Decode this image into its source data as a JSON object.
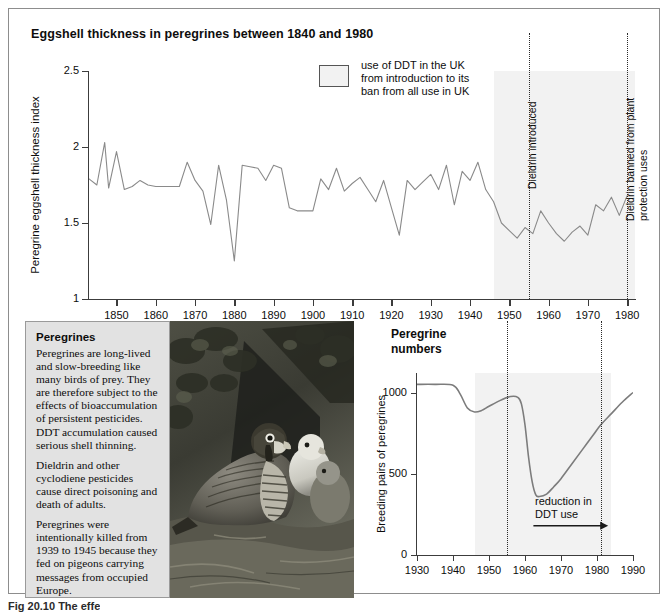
{
  "figure": {
    "title": "Eggshell thickness in peregrines between 1840 and 1980",
    "caption": "Fig 20.10  The effe"
  },
  "legend": {
    "label": "use of DDT in the UK from introduction to its ban from all use in UK",
    "swatch_color": "#f2f2f2"
  },
  "info_panel": {
    "heading": "Peregrines",
    "paragraphs": [
      "Peregrines are long-lived and slow-breeding like many birds of prey. They are therefore subject to the effects of bioaccumulation of persistent pesticides. DDT accumulation caused serious shell thinning.",
      "Dieldrin and other cyclodiene pesticides cause direct poisoning and death of adults.",
      "Peregrines were intentionally killed from 1939 to 1945 because they fed on pigeons carrying messages from occupied Europe."
    ]
  },
  "photo": {
    "alt": "black-and-white photograph of an adult peregrine falcon with two downy chicks at a cliff nest"
  },
  "chart_data": [
    {
      "type": "line",
      "id": "eggshell-thickness",
      "title": "Eggshell thickness in peregrines between 1840 and 1980",
      "xlabel": "",
      "ylabel": "Peregrine eggshell thickness index",
      "xlim": [
        1843,
        1982
      ],
      "ylim": [
        1,
        2.5
      ],
      "yticks": [
        1,
        1.5,
        2,
        2.5
      ],
      "ytick_labels": [
        "1",
        "1.5",
        "2",
        "2.5"
      ],
      "xticks": [
        1850,
        1860,
        1870,
        1880,
        1890,
        1900,
        1910,
        1920,
        1930,
        1940,
        1950,
        1960,
        1970,
        1980
      ],
      "xtick_labels": [
        "1850",
        "1860",
        "1870",
        "1880",
        "1890",
        "1900",
        "1910",
        "1920",
        "1930",
        "1940",
        "1950",
        "1960",
        "1970",
        "1980"
      ],
      "grid": false,
      "line_color": "#8a8a8a",
      "shaded_region": {
        "label": "use of DDT in the UK",
        "from": 1946,
        "to": 1985,
        "color": "#f2f2f2"
      },
      "annotations": [
        {
          "label": "Dieldrin introduced",
          "x": 1955
        },
        {
          "label": "Dieldrin banned from plant protection uses",
          "x": 1980
        }
      ],
      "x": [
        1843,
        1845,
        1847,
        1848,
        1850,
        1852,
        1854,
        1856,
        1858,
        1860,
        1862,
        1864,
        1866,
        1868,
        1870,
        1872,
        1874,
        1876,
        1878,
        1880,
        1882,
        1884,
        1886,
        1888,
        1890,
        1892,
        1894,
        1896,
        1898,
        1900,
        1902,
        1904,
        1906,
        1908,
        1910,
        1912,
        1914,
        1916,
        1918,
        1920,
        1922,
        1924,
        1926,
        1928,
        1930,
        1932,
        1934,
        1936,
        1938,
        1940,
        1942,
        1944,
        1946,
        1948,
        1950,
        1952,
        1954,
        1956,
        1958,
        1960,
        1962,
        1964,
        1966,
        1968,
        1970,
        1972,
        1974,
        1976,
        1978,
        1980
      ],
      "values": [
        1.79,
        1.75,
        2.03,
        1.73,
        1.97,
        1.72,
        1.74,
        1.78,
        1.75,
        1.74,
        1.74,
        1.74,
        1.74,
        1.9,
        1.78,
        1.71,
        1.49,
        1.88,
        1.65,
        1.25,
        1.88,
        1.87,
        1.86,
        1.78,
        1.88,
        1.86,
        1.6,
        1.58,
        1.58,
        1.58,
        1.79,
        1.72,
        1.86,
        1.71,
        1.76,
        1.8,
        1.72,
        1.64,
        1.78,
        1.6,
        1.42,
        1.78,
        1.72,
        1.77,
        1.82,
        1.72,
        1.88,
        1.62,
        1.84,
        1.78,
        1.9,
        1.72,
        1.64,
        1.5,
        1.45,
        1.4,
        1.47,
        1.43,
        1.58,
        1.5,
        1.43,
        1.38,
        1.44,
        1.48,
        1.42,
        1.62,
        1.58,
        1.67,
        1.55,
        1.68
      ]
    },
    {
      "type": "line",
      "id": "peregrine-numbers",
      "title": "Peregrine numbers",
      "xlabel": "",
      "ylabel": "Breeding pairs of peregrines",
      "xlim": [
        1930,
        1990
      ],
      "ylim": [
        0,
        1120
      ],
      "yticks": [
        0,
        500,
        1000
      ],
      "ytick_labels": [
        "0",
        "500",
        "1000"
      ],
      "xticks": [
        1930,
        1940,
        1950,
        1960,
        1970,
        1980,
        1990
      ],
      "xtick_labels": [
        "1930",
        "1940",
        "1950",
        "1960",
        "1970",
        "1980",
        "1990"
      ],
      "grid": false,
      "line_color": "#7c7c7c",
      "shaded_region": {
        "from": 1946,
        "to": 1984,
        "color": "#f2f2f2"
      },
      "annotations": [
        {
          "label": "reduction in DDT use",
          "type": "arrow",
          "from_x": 1969,
          "to_x": 1982,
          "y": 180
        },
        {
          "label": "",
          "type": "vline",
          "x": 1955
        },
        {
          "label": "",
          "type": "vline",
          "x": 1981
        }
      ],
      "x": [
        1930,
        1935,
        1940,
        1942,
        1944,
        1946,
        1948,
        1950,
        1953,
        1956,
        1958,
        1959,
        1960,
        1961,
        1962,
        1963,
        1964,
        1966,
        1968,
        1970,
        1973,
        1976,
        1979,
        1981,
        1984,
        1987,
        1990
      ],
      "values": [
        1050,
        1050,
        1045,
        990,
        905,
        880,
        890,
        915,
        950,
        975,
        970,
        930,
        800,
        600,
        450,
        370,
        360,
        375,
        420,
        470,
        560,
        650,
        740,
        800,
        870,
        940,
        1000
      ]
    }
  ],
  "numbers_chart_labels": {
    "title_line1": "Peregrine",
    "title_line2": "numbers",
    "arrow_note_line1": "reduction in",
    "arrow_note_line2": "DDT use"
  }
}
